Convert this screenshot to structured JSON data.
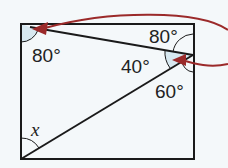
{
  "diagram": {
    "type": "geometry-rectangle-angles",
    "colors": {
      "background": "#f4f8fa",
      "lines": "#1a1a1a",
      "arrow": "#9b2a2a",
      "angle_fill": "#cfe4ee"
    },
    "labels": {
      "top_left_angle": "80°",
      "top_right_angle": "80°",
      "middle_angle": "40°",
      "lower_right_angle": "60°",
      "unknown_angle": "x"
    }
  }
}
